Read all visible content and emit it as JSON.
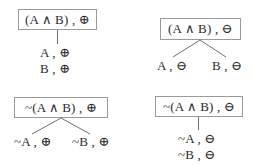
{
  "diagram": {
    "type": "tableau-rules",
    "background_color": "#ffffff",
    "text_color": "#2b2b2b",
    "box_border_color": "#9a9a9a",
    "edge_color": "#6f6f6f",
    "symbols": {
      "conjunction": "∧",
      "negation": "~",
      "positive_sign": "⊕",
      "negative_sign": "⊖",
      "comma": ","
    },
    "rules": [
      {
        "id": "conjunction-positive",
        "position": "top-left",
        "branching": "linear",
        "root_label": "(A ∧ B) , ⊕",
        "leaves": [
          {
            "label": "A , ⊕"
          },
          {
            "label": "B , ⊕"
          }
        ]
      },
      {
        "id": "conjunction-negative",
        "position": "top-right",
        "branching": "split",
        "root_label": "(A ∧ B) , ⊖",
        "leaves": [
          {
            "label": "A , ⊖"
          },
          {
            "label": "B , ⊖"
          }
        ]
      },
      {
        "id": "negated-conjunction-positive",
        "position": "bottom-left",
        "branching": "split",
        "root_label": "~(A ∧ B) , ⊕",
        "leaves": [
          {
            "label": "~A , ⊕"
          },
          {
            "label": "~B , ⊕"
          }
        ]
      },
      {
        "id": "negated-conjunction-negative",
        "position": "bottom-right",
        "branching": "linear",
        "root_label": "~(A ∧ B) , ⊖",
        "leaves": [
          {
            "label": "~A , ⊖"
          },
          {
            "label": "~B , ⊖"
          }
        ]
      }
    ]
  }
}
